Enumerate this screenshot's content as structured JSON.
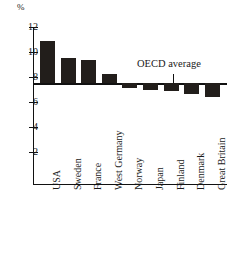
{
  "chart_data": {
    "type": "bar",
    "title": "",
    "subtitle": "",
    "xlabel": "",
    "ylabel": "%",
    "unit_label": "%",
    "categories": [
      "USA",
      "Sweden",
      "France",
      "West Germany",
      "Norway",
      "Japan",
      "Finland",
      "Denmark",
      "Great Britain"
    ],
    "values": [
      10.85,
      9.55,
      9.35,
      8.25,
      7.1,
      7.0,
      6.9,
      6.65,
      6.4
    ],
    "ylim": [
      0,
      12
    ],
    "y_ticks": [
      12,
      10,
      8,
      6,
      4,
      2
    ],
    "y_tick_labels": [
      "12",
      "10",
      "8",
      "6",
      "4",
      "2"
    ],
    "grid": false,
    "legend": "none",
    "baseline": 7.5,
    "annotations": [
      {
        "name": "oecd-average",
        "label": "OECD average",
        "value": 7.5,
        "category_position": "Denmark"
      }
    ],
    "series": [
      {
        "name": "unemployment rate",
        "color": "#221e1b",
        "values": [
          10.85,
          9.55,
          9.35,
          8.25,
          7.1,
          7.0,
          6.9,
          6.65,
          6.4
        ]
      }
    ],
    "colors": {
      "bar": "#221e1b",
      "axis": "#111111",
      "background": "#ffffff",
      "text": "#1a1a1a"
    }
  },
  "axis": {
    "unit": "%",
    "ticks": [
      {
        "label": "12",
        "value": 12
      },
      {
        "label": "10",
        "value": 10
      },
      {
        "label": "8",
        "value": 8
      },
      {
        "label": "6",
        "value": 6
      },
      {
        "label": "4",
        "value": 4
      },
      {
        "label": "2",
        "value": 2
      }
    ]
  },
  "categories": [
    {
      "label": "USA",
      "value": 10.85
    },
    {
      "label": "Sweden",
      "value": 9.55
    },
    {
      "label": "France",
      "value": 9.35
    },
    {
      "label": "West Germany",
      "value": 8.25
    },
    {
      "label": "Norway",
      "value": 7.1
    },
    {
      "label": "Japan",
      "value": 7.0
    },
    {
      "label": "Finland",
      "value": 6.9
    },
    {
      "label": "Denmark",
      "value": 6.65
    },
    {
      "label": "Great Britain",
      "value": 6.4
    }
  ],
  "annotation": {
    "oecd_average_label": "OECD average",
    "oecd_average_value": 7.5
  }
}
